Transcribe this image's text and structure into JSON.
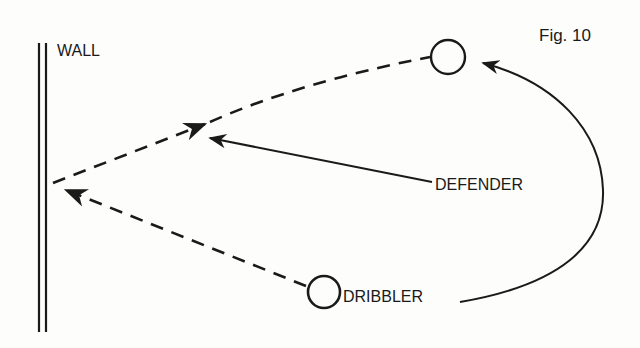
{
  "figure": {
    "caption": "Fig. 10"
  },
  "labels": {
    "wall": "WALL",
    "defender": "DEFENDER",
    "dribbler": "DRIBBLER"
  },
  "colors": {
    "ink": "#1a1a1a",
    "paper": "#fdfdfb"
  },
  "elements": {
    "wall": {
      "type": "double-line",
      "x": [
        39,
        46
      ],
      "y_range": [
        43,
        332
      ]
    },
    "dribbler_start": {
      "type": "circle",
      "cx": 324,
      "cy": 292,
      "r": 16
    },
    "dribbler_end": {
      "type": "circle",
      "cx": 448,
      "cy": 57,
      "r": 17
    },
    "ball_pass_to_wall": {
      "type": "dashed-arrow",
      "from": "dribbler_start",
      "to": "wall"
    },
    "ball_rebound": {
      "type": "dashed-curve",
      "from": "wall",
      "to": "dribbler_end"
    },
    "defender_move": {
      "type": "solid-arrow",
      "from": "defender_label",
      "to": "ball_rebound_path"
    },
    "dribbler_run": {
      "type": "solid-curve-arrow",
      "from": "dribbler_label",
      "to": "dribbler_end"
    }
  }
}
